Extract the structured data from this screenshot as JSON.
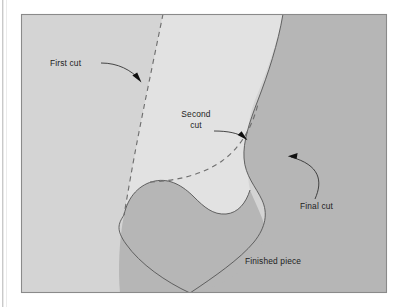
{
  "figure": {
    "colors": {
      "page_background": "#ffffff",
      "frame_border": "#8a8a8a",
      "stock_light": "#d4d4d4",
      "waste_cut_region": "#e2e2e2",
      "finished_piece": "#b6b6b6",
      "outline": "#5b5b5b",
      "dashed_cut_line": "#6f6f6f",
      "leader_line": "#2a2a2a",
      "text": "#1d1d1d",
      "left_margin_rule": "#c9c9c9"
    },
    "frame": {
      "x": 21,
      "y": 14,
      "width": 366,
      "height": 279
    },
    "annotations": [
      {
        "id": "first-cut",
        "label": "First cut",
        "lines": [
          "First cut"
        ],
        "text_x": 50,
        "text_y": 66,
        "anchor": "start",
        "leader_path": "M 101 63 C 118 63, 131 70, 140 80",
        "arrow_points": "140.5,81.5 133.2,75.6 137.1,73.9",
        "target_x": 141,
        "target_y": 82
      },
      {
        "id": "second-cut",
        "label": "Second cut",
        "lines": [
          "Second",
          "cut"
        ],
        "text_x": 196,
        "text_y": 117,
        "anchor": "middle",
        "line_height": 11,
        "leader_path": "M 214 131 C 228 131, 238 133, 245 138",
        "arrow_points": "246.5,139.6 238.6,134.4 242.2,132.1",
        "target_x": 247,
        "target_y": 140
      },
      {
        "id": "final-cut",
        "label": "Final cut",
        "lines": [
          "Final cut"
        ],
        "text_x": 300,
        "text_y": 209,
        "anchor": "start",
        "leader_path": "M 315 198 C 322 180, 320 165, 291 157",
        "arrow_points": "288.6,156.4 297.1,153.2 296.2,158.2",
        "target_x": 288,
        "target_y": 156
      },
      {
        "id": "finished-piece",
        "label": "Finished piece",
        "lines": [
          "Finished piece"
        ],
        "text_x": 245,
        "text_y": 264,
        "anchor": "start",
        "leader_path": "",
        "arrow_points": "",
        "target_x": 0,
        "target_y": 0
      }
    ],
    "cut_lines": [
      {
        "id": "first-cut-line",
        "name": "first cut dashed line",
        "path": "M 163 14 C 157 44, 148 86, 139 132 C 133 162, 128 192, 124 215"
      },
      {
        "id": "second-cut-line",
        "name": "second cut dashed line",
        "path": "M 150 182 C 176 181, 202 175, 222 161 C 240 148, 252 128, 258 104"
      }
    ],
    "piece_outline_path": "M 283 14 C 278 44, 268 74, 258 100 C 249 123, 243 142, 244 158 C 245 176, 256 187, 262 200 C 268 213, 266 227, 254 242 C 240 259, 214 277, 190 293",
    "inner_outline_path": "M 124 215 C 128 196, 140 184, 155 181 C 170 178, 183 186, 194 197 C 204 207, 213 215, 226 214 C 238 213, 246 203, 250 190",
    "regions": [
      {
        "id": "stock-left",
        "name": "uncut stock (left)",
        "fill_key": "stock_light"
      },
      {
        "id": "waste-region",
        "name": "removed waste between cuts",
        "fill_key": "waste_cut_region"
      },
      {
        "id": "finished-region",
        "name": "finished piece shading",
        "fill_key": "finished_piece"
      }
    ]
  }
}
